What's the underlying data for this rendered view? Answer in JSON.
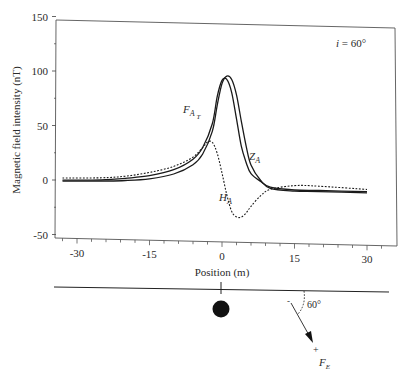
{
  "chart_data": {
    "type": "line",
    "title": "",
    "annotation_inclination": "i = 60°",
    "xlabel": "Position (m)",
    "ylabel": "Magnetic field intensity (nT)",
    "xlim": [
      -35,
      35
    ],
    "ylim": [
      -50,
      150
    ],
    "xticks": [
      -30,
      -15,
      0,
      15,
      30
    ],
    "xtick_labels": [
      "-30",
      "-15",
      "0",
      "15",
      "30"
    ],
    "yticks": [
      -50,
      0,
      50,
      100,
      150
    ],
    "ytick_labels": [
      "-50",
      "0",
      "50",
      "100",
      "150"
    ],
    "grid": false,
    "legend": "none (inline curve labels)",
    "series": [
      {
        "name": "F_AT",
        "label": "F",
        "label_sub": "A",
        "label_subsub": "T",
        "style": "solid",
        "x": [
          -33,
          -25,
          -20,
          -15,
          -10,
          -6,
          -4,
          -2,
          -1,
          0,
          1,
          2,
          3,
          4,
          5,
          6,
          8,
          10,
          15,
          20,
          30
        ],
        "y": [
          0,
          1,
          3,
          6,
          12,
          22,
          33,
          55,
          80,
          95,
          96,
          84,
          60,
          35,
          20,
          10,
          3,
          -2,
          -4,
          -4,
          -4
        ]
      },
      {
        "name": "Z_A",
        "label": "Z",
        "label_sub": "A",
        "style": "solid",
        "x": [
          -33,
          -25,
          -20,
          -15,
          -10,
          -6,
          -4,
          -2,
          -1,
          0,
          1,
          2,
          3,
          4,
          5,
          6,
          8,
          10,
          15,
          20,
          30
        ],
        "y": [
          -1,
          0,
          1,
          3,
          8,
          17,
          27,
          48,
          72,
          92,
          99,
          96,
          82,
          58,
          35,
          18,
          4,
          -3,
          -5,
          -5,
          -5
        ]
      },
      {
        "name": "H_A",
        "label": "H",
        "label_sub": "A",
        "style": "dotted",
        "x": [
          -33,
          -25,
          -20,
          -15,
          -10,
          -6,
          -4,
          -3,
          -2,
          -1,
          0,
          1,
          2,
          3,
          4,
          5,
          6,
          8,
          10,
          15,
          20,
          30
        ],
        "y": [
          2,
          3,
          5,
          9,
          15,
          24,
          33,
          38,
          38,
          28,
          10,
          -10,
          -25,
          -30,
          -30,
          -26,
          -20,
          -10,
          -4,
          0,
          0,
          -2
        ]
      }
    ],
    "schematic": {
      "surface_line": true,
      "source": "filled circle at position 0",
      "field_vector_label": "F",
      "field_vector_sub": "E",
      "angle_label": "60°"
    }
  }
}
